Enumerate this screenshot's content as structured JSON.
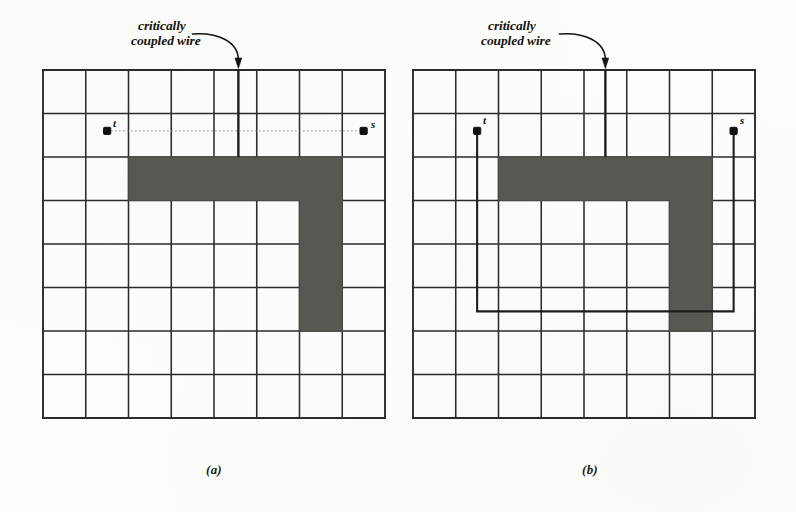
{
  "figure": {
    "kind": "routing-congestion-diagram",
    "background_color": "#fdfdfb",
    "ink_color": "#2b2b28",
    "blockage_color": "#595751",
    "wire_color": "#1d1d1b"
  },
  "annotation": {
    "line1": "critically",
    "line2": "coupled wire",
    "arrow": "curved-arrow-down"
  },
  "panels": [
    {
      "id": "a",
      "caption": "(a)",
      "grid": {
        "cols": 8,
        "rows": 8,
        "x": 43,
        "y": 70,
        "cell_w": 42.75,
        "cell_h": 43.5
      },
      "blockage": {
        "shape": "gamma",
        "horizontal_span_cols": [
          2,
          7
        ],
        "horizontal_row": 2,
        "vertical_col": 6,
        "vertical_span_rows": [
          2,
          5
        ]
      },
      "terminals": [
        {
          "name": "t",
          "label": "t",
          "col": 1.5,
          "row": 1.4
        },
        {
          "name": "s",
          "label": "s",
          "col": 7.5,
          "row": 1.4
        }
      ],
      "connection": {
        "style": "dashed-direct",
        "description": "faint dashed straight line between t and s"
      },
      "critically_coupled_wire": {
        "col": 4.57,
        "from_row": 0,
        "to_row": 2,
        "description": "vertical wire from top border down to blockage top edge"
      }
    },
    {
      "id": "b",
      "caption": "(b)",
      "grid": {
        "cols": 8,
        "rows": 8,
        "x": 413,
        "y": 70,
        "cell_w": 42.75,
        "cell_h": 43.5
      },
      "blockage": {
        "shape": "gamma",
        "horizontal_span_cols": [
          2,
          7
        ],
        "horizontal_row": 2,
        "vertical_col": 6,
        "vertical_span_rows": [
          2,
          5
        ]
      },
      "terminals": [
        {
          "name": "t",
          "label": "t",
          "col": 1.5,
          "row": 1.4
        },
        {
          "name": "s",
          "label": "s",
          "col": 7.5,
          "row": 1.4
        }
      ],
      "connection": {
        "style": "orthogonal-detour",
        "description": "t routes down to row 5.55, across to col 7.5, then up to s"
      },
      "critically_coupled_wire": {
        "col": 4.5,
        "from_row": 0,
        "to_row": 2,
        "description": "vertical wire from top border down to blockage top edge"
      }
    }
  ]
}
